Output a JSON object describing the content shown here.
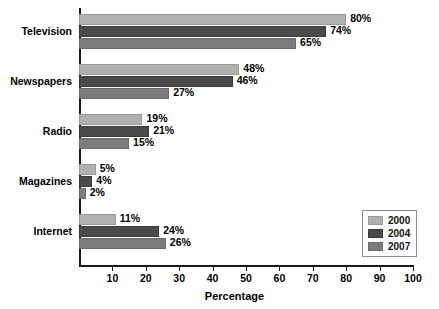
{
  "chart_data": {
    "type": "bar",
    "orientation": "horizontal",
    "title": "",
    "xlabel": "Percentage",
    "ylabel": "",
    "xlim": [
      0,
      100
    ],
    "xticks": [
      10,
      20,
      30,
      40,
      50,
      60,
      70,
      80,
      90,
      100
    ],
    "grid": false,
    "legend_position": "bottom-right",
    "categories": [
      "Television",
      "Newspapers",
      "Radio",
      "Magazines",
      "Internet"
    ],
    "series": [
      {
        "name": "2000",
        "color": "#b0b0b0",
        "values": [
          80,
          48,
          19,
          5,
          11
        ]
      },
      {
        "name": "2004",
        "color": "#4a4a4a",
        "values": [
          74,
          46,
          21,
          4,
          24
        ]
      },
      {
        "name": "2007",
        "color": "#7c7c7c",
        "values": [
          65,
          27,
          15,
          2,
          26
        ]
      }
    ],
    "value_labels": [
      [
        "80%",
        "74%",
        "65%"
      ],
      [
        "48%",
        "46%",
        "27%"
      ],
      [
        "19%",
        "21%",
        "15%"
      ],
      [
        "5%",
        "4%",
        "2%"
      ],
      [
        "11%",
        "24%",
        "26%"
      ]
    ]
  },
  "axis": {
    "x_title": "Percentage",
    "tick_labels": [
      "10",
      "20",
      "30",
      "40",
      "50",
      "60",
      "70",
      "80",
      "90",
      "100"
    ]
  },
  "legend": {
    "items": [
      {
        "label": "2000"
      },
      {
        "label": "2004"
      },
      {
        "label": "2007"
      }
    ]
  },
  "categories": [
    {
      "label": "Television"
    },
    {
      "label": "Newspapers"
    },
    {
      "label": "Radio"
    },
    {
      "label": "Magazines"
    },
    {
      "label": "Internet"
    }
  ]
}
